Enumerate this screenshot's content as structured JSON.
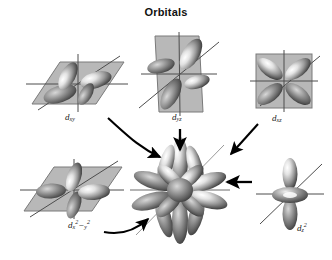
{
  "figure": {
    "title": "Orbitals",
    "background": "#ffffff",
    "style": "grayscale shaded 3D orbital lobes on grey planes with black arrows"
  },
  "orbitals": [
    {
      "id": "dxy",
      "label_d": "d",
      "label_sub": "xy",
      "label_sup": "",
      "plane": "parallelogram-horizontal",
      "lobes": 4,
      "description": "four-lobed cloverleaf lying in a horizontal plane, lobes between axes"
    },
    {
      "id": "dyz",
      "label_d": "d",
      "label_sub": "yz",
      "label_sup": "",
      "plane": "parallelogram-vertical",
      "lobes": 4,
      "description": "four-lobed cloverleaf lying in a vertical yz plane"
    },
    {
      "id": "dxz",
      "label_d": "d",
      "label_sub": "xz",
      "label_sup": "",
      "plane": "square-frontal",
      "lobes": 4,
      "description": "four-lobed cloverleaf lying in a frontal xz plane"
    },
    {
      "id": "dx2y2",
      "label_d": "d",
      "label_sub": "x",
      "label_sup": "2",
      "label_sub2": "y",
      "label_sup2": "2",
      "label_minus": "−",
      "plane": "parallelogram-horizontal",
      "lobes": 4,
      "description": "four-lobed cloverleaf in horizontal plane, lobes along the axes"
    },
    {
      "id": "dz2",
      "label_d": "d",
      "label_sub": "z",
      "label_sup": "2",
      "plane": "none",
      "lobes": 2,
      "torus": true,
      "description": "two vertical lobes along z with a doughnut-shaped torus in the xy plane"
    }
  ],
  "composite": {
    "id": "composite",
    "description": "superposition of all five d orbitals forming a many-lobed rosette",
    "lobe_count": 18
  },
  "arrows": [
    {
      "from": "dxy",
      "to": "composite",
      "shape": "curved",
      "direction": "down-right"
    },
    {
      "from": "dyz",
      "to": "composite",
      "shape": "straight",
      "direction": "down"
    },
    {
      "from": "dxz",
      "to": "composite",
      "shape": "straight",
      "direction": "down-left"
    },
    {
      "from": "dz2",
      "to": "composite",
      "shape": "straight",
      "direction": "left"
    },
    {
      "from": "dx2y2",
      "to": "composite",
      "shape": "curved",
      "direction": "up-right"
    }
  ],
  "colors": {
    "plane_fill": "#b8b8b8",
    "plane_stroke": "#6e6e6e",
    "axis": "#555555",
    "lobe_dark": "#3a3a3a",
    "lobe_mid": "#8e8e8e",
    "lobe_light": "#f2f2f2",
    "arrow": "#000000",
    "title": "#111111"
  }
}
